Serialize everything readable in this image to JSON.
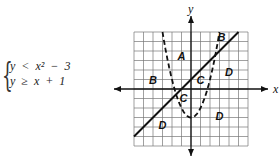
{
  "system": {
    "line1": "y  <  x²  −  3",
    "line2": "y  ≥  x  +  1"
  },
  "chart_data": {
    "type": "line",
    "title": "",
    "xlabel": "x",
    "ylabel": "y",
    "xlim": [
      -6,
      6
    ],
    "ylim": [
      -6,
      6
    ],
    "grid": true,
    "series": [
      {
        "name": "y = x^2 - 3",
        "style": "dashed",
        "inequality": "y < x^2 - 3"
      },
      {
        "name": "y = x + 1",
        "style": "solid",
        "inequality": "y >= x + 1"
      }
    ],
    "region_labels": [
      {
        "label": "A",
        "x": -1,
        "y": 3.5
      },
      {
        "label": "B",
        "x": -4,
        "y": 0.9
      },
      {
        "label": "B",
        "x": 3.2,
        "y": 5.5
      },
      {
        "label": "C",
        "x": 1,
        "y": 0.9
      },
      {
        "label": "C",
        "x": -0.8,
        "y": -0.9
      },
      {
        "label": "D",
        "x": 4,
        "y": 1.8
      },
      {
        "label": "D",
        "x": 3,
        "y": -2.8
      },
      {
        "label": "D",
        "x": -3,
        "y": -3.8
      }
    ]
  }
}
